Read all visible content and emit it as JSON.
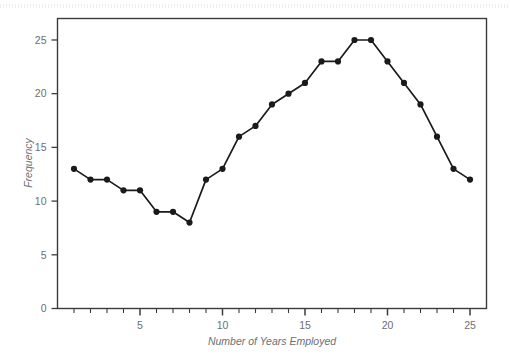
{
  "chart_data": {
    "type": "line",
    "title": "",
    "xlabel": "Number of Years Employed",
    "ylabel": "Frequency",
    "x": [
      1,
      2,
      3,
      4,
      5,
      6,
      7,
      8,
      9,
      10,
      11,
      12,
      13,
      14,
      15,
      16,
      17,
      18,
      19,
      20,
      21,
      22,
      23,
      24,
      25
    ],
    "values": [
      13,
      12,
      12,
      11,
      11,
      9,
      9,
      8,
      12,
      13,
      16,
      17,
      19,
      20,
      21,
      23,
      23,
      25,
      25,
      23,
      21,
      19,
      16,
      13,
      12
    ],
    "series": [
      {
        "name": "Frequency",
        "values": [
          13,
          12,
          12,
          11,
          11,
          9,
          9,
          8,
          12,
          13,
          16,
          17,
          19,
          20,
          21,
          23,
          23,
          25,
          25,
          23,
          21,
          19,
          16,
          13,
          12
        ]
      }
    ],
    "xlim": [
      0,
      26
    ],
    "ylim": [
      0,
      27
    ],
    "x_ticks_major": [
      5,
      10,
      15,
      20,
      25
    ],
    "x_ticks_minor": [
      1,
      2,
      3,
      4,
      6,
      7,
      8,
      9,
      11,
      12,
      13,
      14,
      16,
      17,
      18,
      19,
      21,
      22,
      23,
      24
    ],
    "x_tick_labels": [
      "5",
      "10",
      "15",
      "20",
      "25"
    ],
    "y_ticks": [
      0,
      5,
      10,
      15,
      20,
      25
    ],
    "y_tick_labels": [
      "0",
      "5",
      "10",
      "15",
      "20",
      "25"
    ],
    "grid": false,
    "legend": null,
    "legend_position": "none",
    "marker": "circle",
    "line_color": "#1a1a1a",
    "marker_color": "#1a1a1a",
    "frame_color": "#3c3c3c",
    "tick_label_color": "#6e6e72",
    "axis_title_color": "#6e6e72",
    "background_color": "#ffffff"
  },
  "figure": {
    "axis_title_x": "Number of Years Employed",
    "axis_title_y": "Frequency"
  }
}
